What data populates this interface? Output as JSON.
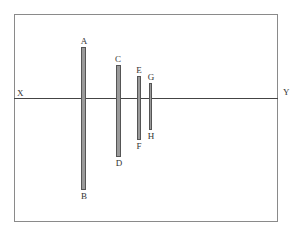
{
  "diagram": {
    "axis": {
      "left_label": "X",
      "right_label": "Y"
    },
    "bars": [
      {
        "top_label": "A",
        "bottom_label": "B"
      },
      {
        "top_label": "C",
        "bottom_label": "D"
      },
      {
        "top_label": "E",
        "bottom_label": "F"
      },
      {
        "top_label": "G",
        "bottom_label": "H"
      }
    ],
    "colors": {
      "bar_fill": "#9a9a9a",
      "bar_stroke": "#555555",
      "line": "#444444",
      "frame": "#8a8a8a"
    }
  }
}
